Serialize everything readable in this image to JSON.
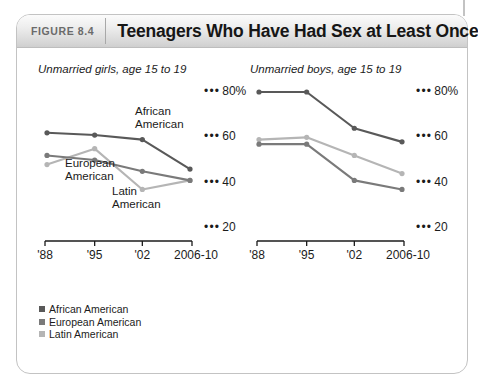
{
  "figure": {
    "number_label": "FIGURE 8.4",
    "title": "Teenagers Who Have Had Sex at Least Once"
  },
  "colors": {
    "african_american": "#595959",
    "european_american": "#7a7a7a",
    "latin_american": "#b5b5b5",
    "axis": "#1b1b1b",
    "frame_border": "#c3c3c3",
    "header_text": "#6b6b6b"
  },
  "legend": {
    "items": [
      {
        "label": "African American",
        "color": "#595959"
      },
      {
        "label": "European American",
        "color": "#7a7a7a"
      },
      {
        "label": "Latin American",
        "color": "#b5b5b5"
      }
    ]
  },
  "panels": {
    "girls": {
      "subtitle": "Unmarried girls, age 15 to 19",
      "annotations": [
        {
          "name": "african-american",
          "line1": "African",
          "line2": "American"
        },
        {
          "name": "european-american",
          "line1": "European",
          "line2": "American"
        },
        {
          "name": "latin-american",
          "line1": "Latin",
          "line2": "American"
        }
      ]
    },
    "boys": {
      "subtitle": "Unmarried boys, age 15 to 19",
      "annotations": []
    }
  },
  "axis": {
    "y_ticks": [
      "80%",
      "60",
      "40",
      "20"
    ],
    "y_values": [
      80,
      60,
      40,
      20
    ],
    "x_ticks": [
      "'88",
      "'95",
      "'02",
      "2006-10"
    ]
  },
  "chart_data": [
    {
      "type": "line",
      "title": "Unmarried girls, age 15 to 19",
      "xlabel": "",
      "ylabel": "",
      "categories": [
        "'88",
        "'95",
        "'02",
        "2006-10"
      ],
      "ylim": [
        20,
        80
      ],
      "grid": false,
      "legend_position": "inline-annotations",
      "series": [
        {
          "name": "African American",
          "color": "#595959",
          "values": [
            62,
            61,
            59,
            46
          ]
        },
        {
          "name": "European American",
          "color": "#7a7a7a",
          "values": [
            52,
            50,
            45,
            41
          ]
        },
        {
          "name": "Latin American",
          "color": "#b5b5b5",
          "values": [
            48,
            55,
            37,
            41
          ]
        }
      ]
    },
    {
      "type": "line",
      "title": "Unmarried boys, age 15 to 19",
      "xlabel": "",
      "ylabel": "",
      "categories": [
        "'88",
        "'95",
        "'02",
        "2006-10"
      ],
      "ylim": [
        20,
        80
      ],
      "grid": false,
      "legend_position": "bottom",
      "series": [
        {
          "name": "African American",
          "color": "#595959",
          "values": [
            80,
            80,
            64,
            58
          ]
        },
        {
          "name": "European American",
          "color": "#7a7a7a",
          "values": [
            57,
            57,
            41,
            37
          ]
        },
        {
          "name": "Latin American",
          "color": "#b5b5b5",
          "values": [
            59,
            60,
            52,
            44
          ]
        }
      ]
    }
  ]
}
